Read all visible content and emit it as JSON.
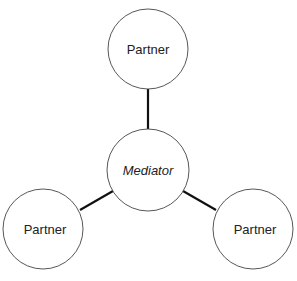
{
  "diagram": {
    "colors": {
      "stroke": "#333333",
      "edge": "#111111",
      "fill": "#ffffff",
      "text": "#222222"
    },
    "nodes": [
      {
        "id": "top",
        "label": "Partner"
      },
      {
        "id": "center",
        "label": "Mediator"
      },
      {
        "id": "left",
        "label": "Partner"
      },
      {
        "id": "right",
        "label": "Partner"
      }
    ],
    "edges": [
      {
        "from": "center",
        "to": "top"
      },
      {
        "from": "center",
        "to": "left"
      },
      {
        "from": "center",
        "to": "right"
      }
    ]
  }
}
